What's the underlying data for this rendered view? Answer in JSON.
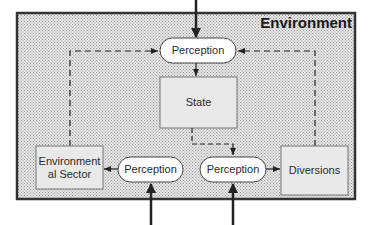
{
  "diagram": {
    "container": {
      "label": "Environment"
    },
    "nodes": [
      {
        "id": "perception-top",
        "label": "Perception",
        "shape": "pill"
      },
      {
        "id": "state",
        "label": "State",
        "shape": "box"
      },
      {
        "id": "environmental-sector",
        "label": "Environmental Sector",
        "shape": "box"
      },
      {
        "id": "perception-left",
        "label": "Perception",
        "shape": "pill"
      },
      {
        "id": "perception-right",
        "label": "Perception",
        "shape": "pill"
      },
      {
        "id": "diversions",
        "label": "Diversions",
        "shape": "box"
      }
    ],
    "edges": [
      {
        "from": "external-top",
        "to": "perception-top",
        "style": "solid-thick"
      },
      {
        "from": "perception-top",
        "to": "state",
        "style": "solid"
      },
      {
        "from": "state",
        "to": "perception-right",
        "style": "dashed"
      },
      {
        "from": "environmental-sector",
        "to": "perception-top",
        "style": "dashed"
      },
      {
        "from": "diversions",
        "to": "perception-top",
        "style": "dashed"
      },
      {
        "from": "perception-left",
        "to": "environmental-sector",
        "style": "solid"
      },
      {
        "from": "perception-right",
        "to": "diversions",
        "style": "solid"
      },
      {
        "from": "external-bottom-left",
        "to": "perception-left",
        "style": "solid-thick"
      },
      {
        "from": "external-bottom-right",
        "to": "perception-right",
        "style": "solid-thick"
      }
    ],
    "colors": {
      "frame": "#333333",
      "pattern_bg": "#d8d8d8",
      "box_fill": "#e8e8e8",
      "pill_fill": "#ffffff",
      "line": "#222222"
    }
  }
}
